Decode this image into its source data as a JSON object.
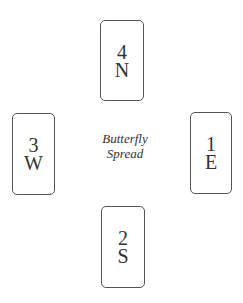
{
  "diagram": {
    "title_lines": [
      "Butterfly",
      "Spread"
    ],
    "cards": [
      {
        "position": "north",
        "number": "4",
        "direction": "N"
      },
      {
        "position": "west",
        "number": "3",
        "direction": "W"
      },
      {
        "position": "east",
        "number": "1",
        "direction": "E"
      },
      {
        "position": "south",
        "number": "2",
        "direction": "S"
      }
    ]
  }
}
